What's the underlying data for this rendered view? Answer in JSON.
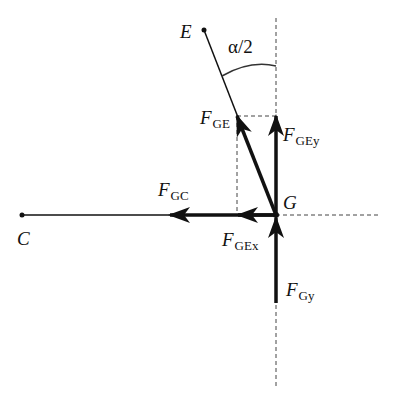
{
  "diagram": {
    "points": {
      "E": {
        "label": "E",
        "x": 204,
        "y": 30
      },
      "C": {
        "label": "C",
        "x": 22,
        "y": 215
      },
      "G": {
        "label": "G",
        "x": 276,
        "y": 215
      }
    },
    "angle": {
      "label": "α/2"
    },
    "forces": [
      {
        "id": "F_GE",
        "symbol": "F",
        "subscript": "GE",
        "direction": "toward E"
      },
      {
        "id": "F_GEy",
        "symbol": "F",
        "subscript": "GEy",
        "direction": "up"
      },
      {
        "id": "F_GC",
        "symbol": "F",
        "subscript": "GC",
        "direction": "toward C"
      },
      {
        "id": "F_GEx",
        "symbol": "F",
        "subscript": "GEx",
        "direction": "left"
      },
      {
        "id": "F_Gy",
        "symbol": "F",
        "subscript": "Gy",
        "direction": "up"
      }
    ],
    "colors": {
      "stroke": "#111111",
      "dashed": "#444444",
      "background": "#ffffff"
    }
  }
}
